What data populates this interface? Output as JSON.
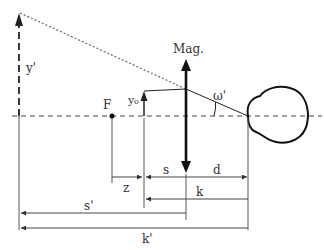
{
  "diagram": {
    "type": "optics-magnifier-geometry",
    "colors": {
      "line": "#222222",
      "thin_line": "#555555",
      "dotted": "#666666",
      "text": "#333333",
      "background": "#ffffff"
    },
    "labels": {
      "lens": "Mag.",
      "image_height": "y'",
      "object_height": "y₀",
      "focal_point": "F",
      "angle": "ω'",
      "z": "z",
      "s": "s",
      "d": "d",
      "k": "k",
      "s_prime": "s'",
      "k_prime": "k'"
    },
    "elements": {
      "optical_axis": "dashed horizontal axis",
      "virtual_image": "dashed arrow y' at left",
      "object": "arrow y₀",
      "lens": "double-headed vertical arrow",
      "eye": "eye outline at right",
      "ray": "dotted line from top of y' to lens, solid line to eye"
    }
  }
}
